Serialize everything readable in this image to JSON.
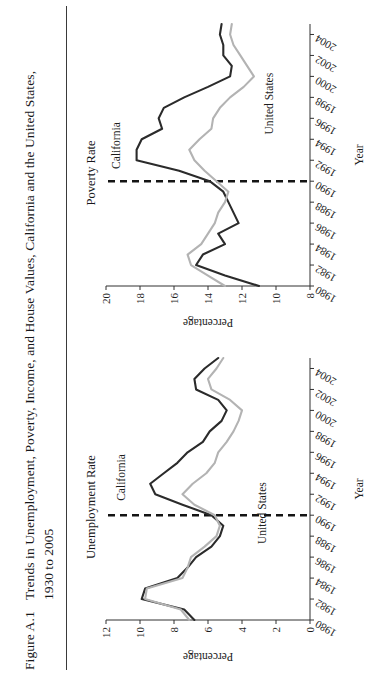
{
  "figure": {
    "number": "Figure A.1",
    "caption_line1": "Trends in Unemployment, Poverty, Income, and House Values, California and the United States,",
    "caption_line2": "1930 to 2005"
  },
  "colors": {
    "california": "#2b2b2b",
    "united_states": "#b3b3b3",
    "axis": "#303030",
    "refline": "#141414",
    "text": "#1d1d1d"
  },
  "chart_data": [
    {
      "type": "line",
      "title": "Unemployment Rate",
      "xlabel": "Year",
      "ylabel": "Percentage",
      "xlim": [
        1980,
        2005
      ],
      "ylim": [
        0,
        12
      ],
      "yticks": [
        0,
        2,
        4,
        6,
        8,
        10,
        12
      ],
      "xticks": [
        1980,
        1982,
        1984,
        1986,
        1988,
        1990,
        1992,
        1994,
        1996,
        1998,
        2000,
        2002,
        2004
      ],
      "grid": false,
      "legend": "inline-labels",
      "annotations": [
        {
          "text": "California",
          "series": "California"
        },
        {
          "text": "United States",
          "series": "United States"
        }
      ],
      "reference_line": {
        "x": 1990,
        "style": "dashed"
      },
      "x": [
        1980,
        1981,
        1982,
        1983,
        1984,
        1985,
        1986,
        1987,
        1988,
        1989,
        1990,
        1991,
        1992,
        1993,
        1994,
        1995,
        1996,
        1997,
        1998,
        1999,
        2000,
        2001,
        2002,
        2003,
        2004,
        2005
      ],
      "series": [
        {
          "name": "California",
          "values": [
            6.8,
            7.4,
            9.9,
            9.7,
            7.8,
            7.2,
            6.7,
            5.8,
            5.3,
            5.1,
            5.8,
            7.5,
            9.1,
            9.4,
            8.6,
            7.8,
            7.2,
            6.3,
            5.9,
            5.2,
            4.9,
            5.4,
            6.7,
            6.8,
            6.2,
            5.4
          ],
          "color": "#2b2b2b"
        },
        {
          "name": "United States",
          "values": [
            7.1,
            7.6,
            9.7,
            9.6,
            7.5,
            7.2,
            7.0,
            6.2,
            5.5,
            5.3,
            5.6,
            6.8,
            7.5,
            6.9,
            6.1,
            5.6,
            5.4,
            4.9,
            4.5,
            4.2,
            4.0,
            4.7,
            5.8,
            6.0,
            5.5,
            5.1
          ],
          "color": "#b3b3b3"
        }
      ]
    },
    {
      "type": "line",
      "title": "Poverty Rate",
      "xlabel": "Year",
      "ylabel": "Percentage",
      "xlim": [
        1980,
        2005
      ],
      "ylim": [
        8,
        20
      ],
      "yticks": [
        8,
        10,
        12,
        14,
        16,
        18,
        20
      ],
      "xticks": [
        1980,
        1982,
        1984,
        1986,
        1988,
        1990,
        1992,
        1994,
        1996,
        1998,
        2000,
        2002,
        2004
      ],
      "grid": false,
      "legend": "inline-labels",
      "annotations": [
        {
          "text": "California",
          "series": "California"
        },
        {
          "text": "United States",
          "series": "United States"
        }
      ],
      "reference_line": {
        "x": 1990,
        "style": "dashed"
      },
      "x": [
        1980,
        1981,
        1982,
        1983,
        1984,
        1985,
        1986,
        1987,
        1988,
        1989,
        1990,
        1991,
        1992,
        1993,
        1994,
        1995,
        1996,
        1997,
        1998,
        1999,
        2000,
        2001,
        2002,
        2003,
        2004,
        2005
      ],
      "series": [
        {
          "name": "California",
          "values": [
            11.0,
            13.0,
            14.7,
            14.3,
            13.0,
            13.4,
            12.2,
            12.5,
            12.8,
            13.1,
            13.9,
            15.7,
            18.2,
            18.2,
            17.9,
            16.7,
            16.9,
            16.6,
            15.4,
            14.0,
            12.7,
            12.6,
            13.1,
            13.1,
            13.3,
            13.2
          ],
          "color": "#2b2b2b"
        },
        {
          "name": "United States",
          "values": [
            13.0,
            14.0,
            15.0,
            15.2,
            14.4,
            14.0,
            13.6,
            13.4,
            13.0,
            12.8,
            13.5,
            14.2,
            14.8,
            15.1,
            14.5,
            13.8,
            13.7,
            13.3,
            12.7,
            11.9,
            11.3,
            11.7,
            12.1,
            12.5,
            12.7,
            12.6
          ],
          "color": "#b3b3b3"
        }
      ]
    }
  ]
}
